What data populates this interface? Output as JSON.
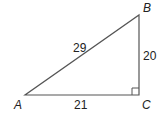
{
  "diagram": {
    "type": "right-triangle",
    "vertices": {
      "A": {
        "label": "A"
      },
      "B": {
        "label": "B"
      },
      "C": {
        "label": "C"
      }
    },
    "sides": {
      "AB": {
        "label": "29"
      },
      "BC": {
        "label": "20"
      },
      "AC": {
        "label": "21"
      }
    },
    "right_angle_at": "C",
    "stroke_color": "#555555"
  }
}
